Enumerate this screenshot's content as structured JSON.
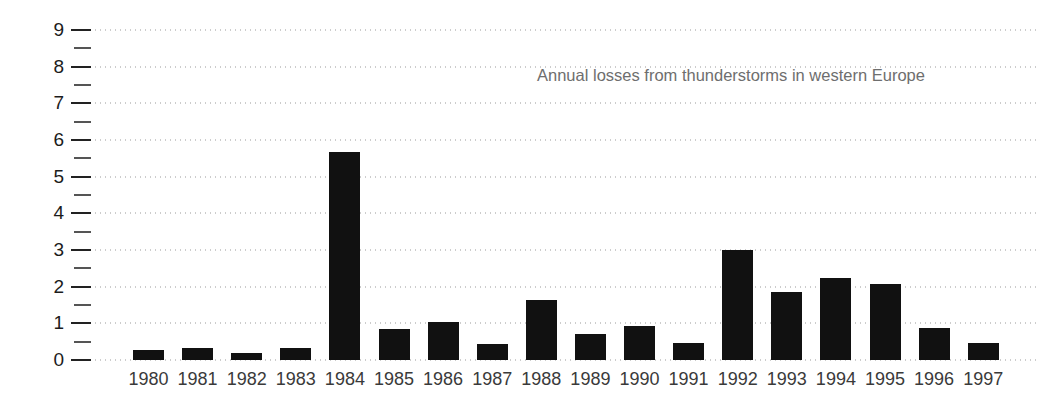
{
  "chart_data": {
    "type": "bar",
    "title": "",
    "annotation": "Annual losses from thunderstorms in western Europe",
    "xlabel": "",
    "ylabel": "",
    "categories": [
      "1980",
      "1981",
      "1982",
      "1983",
      "1984",
      "1985",
      "1986",
      "1987",
      "1988",
      "1989",
      "1990",
      "1991",
      "1992",
      "1993",
      "1994",
      "1995",
      "1996",
      "1997"
    ],
    "values": [
      0.27,
      0.33,
      0.19,
      0.33,
      5.68,
      0.85,
      1.05,
      0.43,
      1.65,
      0.7,
      0.92,
      0.46,
      3.0,
      1.86,
      2.25,
      2.08,
      0.87,
      0.46
    ],
    "ylim": [
      0,
      9
    ],
    "y_major_ticks": [
      0,
      1,
      2,
      3,
      4,
      5,
      6,
      7,
      8,
      9
    ],
    "y_tick_labels": [
      "0",
      "1",
      "2",
      "3",
      "4",
      "5",
      "6",
      "7",
      "8",
      "9"
    ],
    "y_minor_ticks": [
      0.5,
      1.5,
      2.5,
      3.5,
      4.5,
      5.5,
      6.5,
      7.5,
      8.5
    ],
    "grid": true,
    "grid_style": "dotted-horizontal",
    "legend": null,
    "bar_color": "#111111",
    "grid_color": "#9a9a9a",
    "axis_text_color": "#1c1c1c",
    "annotation_color": "#6e6e6e",
    "background": "#ffffff"
  }
}
